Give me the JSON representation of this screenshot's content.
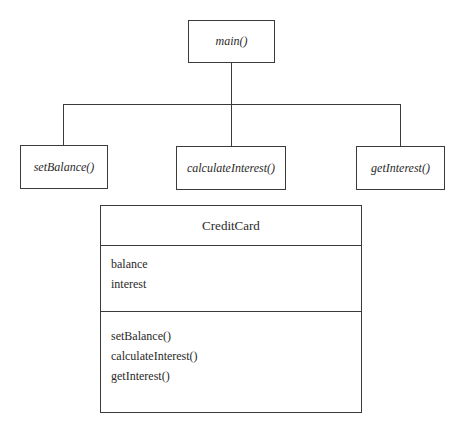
{
  "diagram": {
    "root": {
      "label": "main()"
    },
    "children": [
      {
        "label": "setBalance()"
      },
      {
        "label": "calculateInterest()"
      },
      {
        "label": "getInterest()"
      }
    ],
    "class": {
      "name": "CreditCard",
      "attributes": [
        "balance",
        "interest"
      ],
      "methods": [
        "setBalance()",
        "calculateInterest()",
        "getInterest()"
      ]
    }
  }
}
